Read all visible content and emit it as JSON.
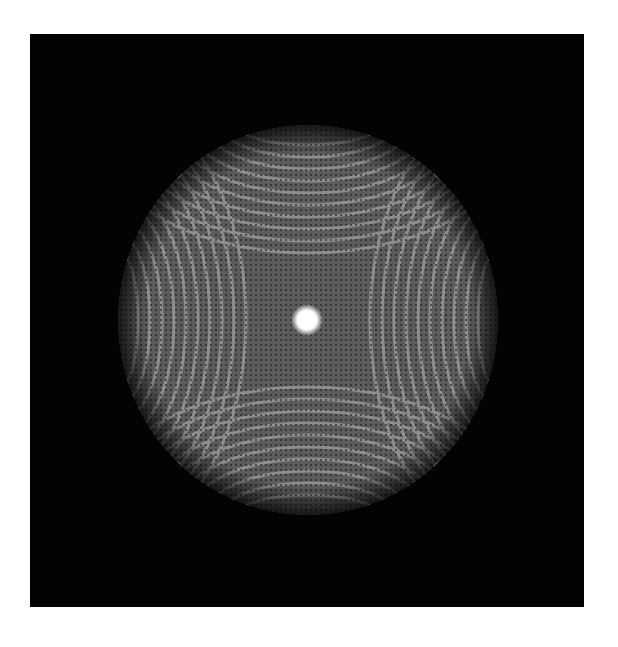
{
  "image": {
    "description": "Grayscale interference/diffraction pattern: circular disk with four families of nested elliptical fringes converging from left, right, top and bottom, bright cusps at the four diagonal edges, and a bright central spot on a black background",
    "background_color": "#ffffff",
    "frame_color": "#030303",
    "disk": {
      "center_x": 278,
      "center_y": 286,
      "radius_x": 190,
      "radius_y": 195,
      "base_gray": "#5a5a5a",
      "fringe_gray": "#8c8c8c",
      "dark_fringe": "#2e2e2e"
    },
    "center_spot": {
      "color": "#ffffff",
      "radius": 12
    },
    "cusp_color": "#c8c8c8"
  }
}
